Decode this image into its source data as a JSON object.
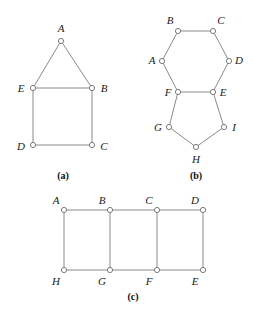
{
  "figure": {
    "background_color": "#ffffff",
    "edge_color": "#8a8a8a",
    "vertex_stroke_color": "#7d7d7d",
    "vertex_fill_color": "#ffffff",
    "label_color": "#1a1a1a",
    "vertex_radius": 2.6,
    "panels": [
      {
        "id": "panel-a",
        "caption": "(a)",
        "caption_x": 63,
        "caption_y": 176,
        "vertices": [
          {
            "label": "A",
            "x": 61,
            "y": 41,
            "label_x": 61,
            "label_y": 28
          },
          {
            "label": "E",
            "x": 33,
            "y": 88,
            "label_x": 21,
            "label_y": 88
          },
          {
            "label": "B",
            "x": 92,
            "y": 88,
            "label_x": 104,
            "label_y": 88
          },
          {
            "label": "D",
            "x": 33,
            "y": 145,
            "label_x": 21,
            "label_y": 146
          },
          {
            "label": "C",
            "x": 92,
            "y": 145,
            "label_x": 104,
            "label_y": 146
          }
        ],
        "edges": [
          [
            "A",
            "E"
          ],
          [
            "A",
            "B"
          ],
          [
            "E",
            "B"
          ],
          [
            "E",
            "D"
          ],
          [
            "B",
            "C"
          ],
          [
            "D",
            "C"
          ]
        ]
      },
      {
        "id": "panel-b",
        "caption": "(b)",
        "caption_x": 196,
        "caption_y": 176,
        "vertices": [
          {
            "label": "B",
            "x": 178,
            "y": 31,
            "label_x": 170,
            "label_y": 20
          },
          {
            "label": "C",
            "x": 213,
            "y": 31,
            "label_x": 221,
            "label_y": 20
          },
          {
            "label": "A",
            "x": 162,
            "y": 61,
            "label_x": 152,
            "label_y": 60
          },
          {
            "label": "D",
            "x": 229,
            "y": 61,
            "label_x": 239,
            "label_y": 60
          },
          {
            "label": "F",
            "x": 178,
            "y": 92,
            "label_x": 168,
            "label_y": 92
          },
          {
            "label": "E",
            "x": 213,
            "y": 92,
            "label_x": 223,
            "label_y": 92
          },
          {
            "label": "G",
            "x": 169,
            "y": 127,
            "label_x": 158,
            "label_y": 127
          },
          {
            "label": "I",
            "x": 224,
            "y": 127,
            "label_x": 234,
            "label_y": 127
          },
          {
            "label": "H",
            "x": 196,
            "y": 147,
            "label_x": 196,
            "label_y": 159
          }
        ],
        "edges": [
          [
            "B",
            "C"
          ],
          [
            "B",
            "A"
          ],
          [
            "C",
            "D"
          ],
          [
            "A",
            "F"
          ],
          [
            "D",
            "E"
          ],
          [
            "F",
            "E"
          ],
          [
            "F",
            "G"
          ],
          [
            "E",
            "I"
          ],
          [
            "G",
            "H"
          ],
          [
            "I",
            "H"
          ]
        ]
      },
      {
        "id": "panel-c",
        "caption": "(c)",
        "caption_x": 133,
        "caption_y": 297,
        "vertices": [
          {
            "label": "A",
            "x": 64,
            "y": 210,
            "label_x": 56,
            "label_y": 200
          },
          {
            "label": "B",
            "x": 110,
            "y": 210,
            "label_x": 102,
            "label_y": 200
          },
          {
            "label": "C",
            "x": 157,
            "y": 210,
            "label_x": 149,
            "label_y": 200
          },
          {
            "label": "D",
            "x": 203,
            "y": 210,
            "label_x": 195,
            "label_y": 200
          },
          {
            "label": "H",
            "x": 64,
            "y": 270,
            "label_x": 56,
            "label_y": 281
          },
          {
            "label": "G",
            "x": 110,
            "y": 270,
            "label_x": 102,
            "label_y": 281
          },
          {
            "label": "F",
            "x": 157,
            "y": 270,
            "label_x": 149,
            "label_y": 281
          },
          {
            "label": "E",
            "x": 203,
            "y": 270,
            "label_x": 195,
            "label_y": 281
          }
        ],
        "edges": [
          [
            "A",
            "B"
          ],
          [
            "B",
            "C"
          ],
          [
            "C",
            "D"
          ],
          [
            "H",
            "G"
          ],
          [
            "G",
            "F"
          ],
          [
            "F",
            "E"
          ],
          [
            "A",
            "H"
          ],
          [
            "B",
            "G"
          ],
          [
            "C",
            "F"
          ],
          [
            "D",
            "E"
          ]
        ]
      }
    ]
  }
}
